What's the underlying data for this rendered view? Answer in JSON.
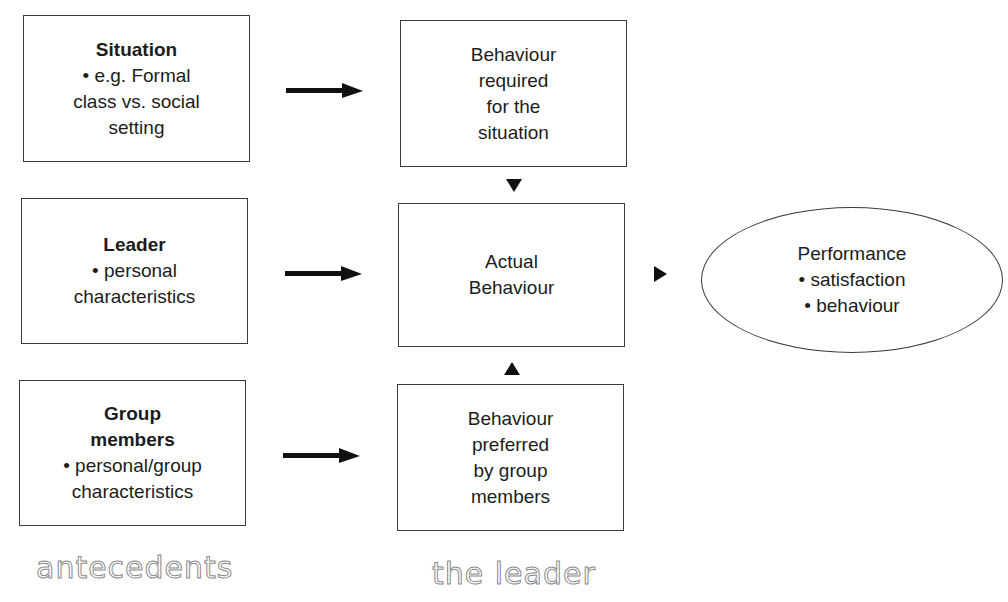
{
  "diagram": {
    "antecedents": {
      "situation": {
        "title": "Situation",
        "lines": [
          "• e.g. Formal",
          "class vs. social",
          "setting"
        ]
      },
      "leader": {
        "title": "Leader",
        "lines": [
          "• personal",
          "characteristics"
        ]
      },
      "group_members": {
        "title_lines": [
          "Group",
          "members"
        ],
        "lines": [
          "• personal/group",
          "characteristics"
        ]
      }
    },
    "leader_column": {
      "required": {
        "lines": [
          "Behaviour",
          "required",
          "for the",
          "situation"
        ]
      },
      "actual": {
        "lines": [
          "Actual",
          "Behaviour"
        ]
      },
      "preferred": {
        "lines": [
          "Behaviour",
          "preferred",
          "by group",
          "members"
        ]
      }
    },
    "outcome": {
      "title": "Performance",
      "lines": [
        "• satisfaction",
        "• behaviour"
      ]
    },
    "column_labels": {
      "left": "antecedents",
      "middle": "the leader"
    },
    "colors": {
      "stroke": "#3a3a3a",
      "text": "#1c1c1c",
      "arrow": "#111111",
      "label_outline": "#8a8a8a"
    }
  }
}
